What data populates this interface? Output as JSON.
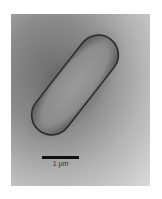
{
  "figure": {
    "type": "electron-micrograph",
    "scale_bar": {
      "label": "1 µm"
    },
    "colors": {
      "background_dark": "#6e6e6e",
      "background_light": "#dadada",
      "cell_fill": "#8f8f8f",
      "cell_edge": "#2a2a2a",
      "scale_bar": "#111111"
    }
  }
}
